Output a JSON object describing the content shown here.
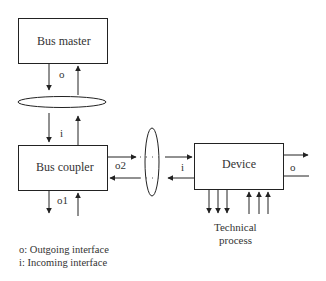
{
  "diagram": {
    "nodes": {
      "bus_master": {
        "label": "Bus master"
      },
      "bus_coupler": {
        "label": "Bus coupler"
      },
      "device": {
        "label": "Device"
      },
      "technical_process": {
        "label_line1": "Technical",
        "label_line2": "process"
      }
    },
    "interface_labels": {
      "master_out": "o",
      "coupler_in": "i",
      "coupler_out2": "o2",
      "coupler_out1": "o1",
      "device_in": "i",
      "device_out": "o"
    },
    "legend": {
      "line1": "o: Outgoing interface",
      "line2": "i: Incoming interface"
    },
    "colors": {
      "stroke": "#222222",
      "background": "#ffffff"
    }
  }
}
